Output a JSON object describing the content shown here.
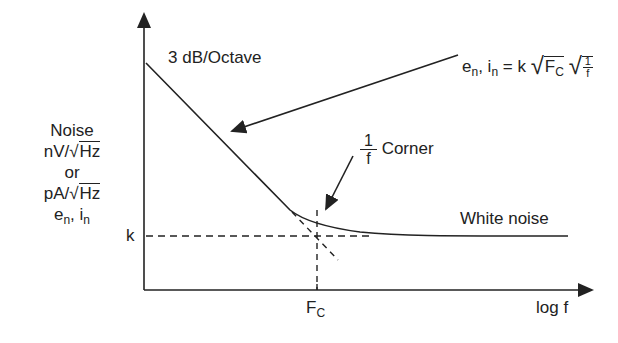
{
  "diagram": {
    "y_axis_label": {
      "line1": "Noise",
      "line2_prefix": "nV/",
      "line2_sqrt": "Hz",
      "line3": "or",
      "line4_prefix": "pA/",
      "line4_sqrt": "Hz",
      "line5_e": "e",
      "line5_e_sub": "n",
      "line5_sep": ", ",
      "line5_i": "i",
      "line5_i_sub": "n"
    },
    "x_axis_label": "log f",
    "k_label": "k",
    "fc_label": "F",
    "fc_sub": "C",
    "slope_label": "3 dB/Octave",
    "equation": {
      "e": "e",
      "e_sub": "n",
      "sep": ", ",
      "i": "i",
      "i_sub": "n",
      "equals": " = k",
      "sqrt1": "F",
      "sqrt1_sub": "C",
      "frac_num": "1",
      "frac_den": "f"
    },
    "corner_label": {
      "frac_num": "1",
      "frac_den": "f",
      "text": "Corner"
    },
    "white_noise_label": "White noise",
    "colors": {
      "line": "#222222",
      "background": "#ffffff"
    }
  }
}
